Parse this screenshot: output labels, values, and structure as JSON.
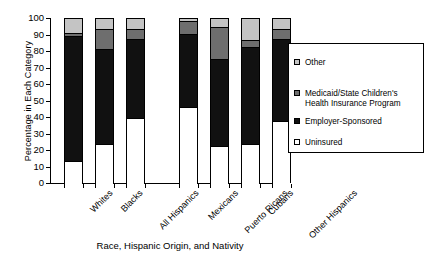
{
  "chart_data": {
    "type": "bar",
    "subtype": "stacked-bar-100",
    "title": "",
    "xlabel": "Race, Hispanic Origin, and Nativity",
    "ylabel": "Percentage in Each Category",
    "ylim": [
      0,
      100
    ],
    "ytick_labels": [
      "0",
      "10",
      "20",
      "30",
      "40",
      "50",
      "60",
      "70",
      "80",
      "90",
      "100"
    ],
    "ytick_values": [
      0,
      10,
      20,
      30,
      40,
      50,
      60,
      70,
      80,
      90,
      100
    ],
    "grid": false,
    "legend_position": "right",
    "categories": [
      "Whites",
      "Blacks",
      "All Hispanics",
      "Mexicans",
      "Puerto Ricans",
      "Cubans",
      "Other Hispanics"
    ],
    "category_gap_after_index": 2,
    "series": [
      {
        "name": "Uninsured",
        "color": "#ffffff",
        "values": [
          14,
          24,
          40,
          46.5,
          23,
          24,
          38
        ]
      },
      {
        "name": "Employer-Sponsored",
        "color": "#111111",
        "values": [
          75.5,
          58,
          48,
          44.5,
          52.5,
          59,
          50
        ]
      },
      {
        "name": "Medicaid/State Children's Health Insurance Program",
        "color": "#6e6e6e",
        "values": [
          2,
          12,
          6,
          7.5,
          19.5,
          4.5,
          6
        ]
      },
      {
        "name": "Other",
        "color": "#c4c4c4",
        "values": [
          8.5,
          6,
          6,
          1.5,
          5,
          12.5,
          6
        ]
      }
    ],
    "cumulative_tops": {
      "Whites": [
        14,
        89.5,
        91.5,
        100
      ],
      "Blacks": [
        24,
        82,
        94,
        100
      ],
      "All Hispanics": [
        40,
        88,
        94,
        100
      ],
      "Mexicans": [
        46.5,
        91,
        98.5,
        100
      ],
      "Puerto Ricans": [
        23,
        75.5,
        95,
        100
      ],
      "Cubans": [
        24,
        83,
        87.5,
        100
      ],
      "Other Hispanics": [
        38,
        88,
        94,
        100
      ]
    }
  },
  "legend": {
    "entries": [
      {
        "label": "Other",
        "color": "#c4c4c4"
      },
      {
        "label": "Medicaid/State Children's\nHealth Insurance Program",
        "color": "#6e6e6e"
      },
      {
        "label": "Employer-Sponsored",
        "color": "#111111"
      },
      {
        "label": "Uninsured",
        "color": "#ffffff"
      }
    ]
  }
}
